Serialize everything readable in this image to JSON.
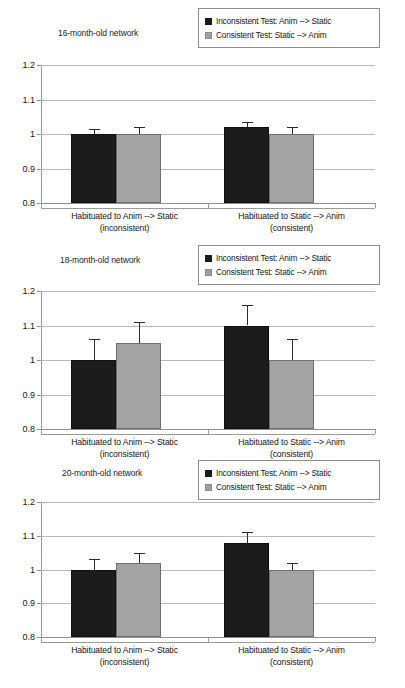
{
  "figure": {
    "panels": [
      {
        "title": "16-month-old network",
        "legend": {
          "items": [
            {
              "swatch": "black-square-icon",
              "label": "Inconsistent Test: Anim --> Static"
            },
            {
              "swatch": "gray-square-icon",
              "label": "Consistent Test: Static --> Anim"
            }
          ]
        },
        "chart_data": {
          "type": "bar",
          "title": "16-month-old network",
          "xlabel": "",
          "ylabel": "",
          "ylim": [
            0.8,
            1.2
          ],
          "yticks": [
            "1.2",
            "1.1",
            "1",
            "0.9",
            "0.8"
          ],
          "ytick_values": [
            1.2,
            1.1,
            1.0,
            0.9,
            0.8
          ],
          "grid": true,
          "legend_position": "top-right",
          "categories": [
            "Habituated to Anim --> Static (inconsistent)",
            "Habituated to Static --> Anim (consistent)"
          ],
          "category_lines": [
            [
              "Habituated to Anim --> Static",
              "(inconsistent)"
            ],
            [
              "Habituated to Static --> Anim",
              "(consistent)"
            ]
          ],
          "series": [
            {
              "name": "Inconsistent Test: Anim --> Static",
              "color": "#1c1c1c",
              "values": [
                1.0,
                1.02
              ],
              "errors": [
                0.015,
                0.015
              ]
            },
            {
              "name": "Consistent Test: Static --> Anim",
              "color": "#a3a3a3",
              "values": [
                1.0,
                1.0
              ],
              "errors": [
                0.02,
                0.02
              ]
            }
          ]
        }
      },
      {
        "title": "18-month-old network",
        "legend": {
          "items": [
            {
              "swatch": "black-square-icon",
              "label": "Inconsistent Test: Anim --> Static"
            },
            {
              "swatch": "gray-square-icon",
              "label": "Consistent Test: Static --> Anim"
            }
          ]
        },
        "chart_data": {
          "type": "bar",
          "title": "18-month-old network",
          "xlabel": "",
          "ylabel": "",
          "ylim": [
            0.8,
            1.2
          ],
          "yticks": [
            "1.2",
            "1.1",
            "1",
            "0.9",
            "0.8"
          ],
          "ytick_values": [
            1.2,
            1.1,
            1.0,
            0.9,
            0.8
          ],
          "grid": true,
          "legend_position": "top-right",
          "categories": [
            "Habituated to Anim --> Static (inconsistent)",
            "Habituated to Static --> Anim (consistent)"
          ],
          "category_lines": [
            [
              "Habituated to Anim --> Static",
              "(inconsistent)"
            ],
            [
              "Habituated to Static --> Anim",
              "(consistent)"
            ]
          ],
          "series": [
            {
              "name": "Inconsistent Test: Anim --> Static",
              "color": "#1c1c1c",
              "values": [
                1.0,
                1.1
              ],
              "errors": [
                0.06,
                0.06
              ]
            },
            {
              "name": "Consistent Test: Static --> Anim",
              "color": "#a3a3a3",
              "values": [
                1.05,
                1.0
              ],
              "errors": [
                0.06,
                0.06
              ]
            }
          ]
        }
      },
      {
        "title": "20-month-old network",
        "legend": {
          "items": [
            {
              "swatch": "black-square-icon",
              "label": "Inconsistent Test: Anim --> Static"
            },
            {
              "swatch": "gray-square-icon",
              "label": "Consistent Test: Static --> Anim"
            }
          ]
        },
        "chart_data": {
          "type": "bar",
          "title": "20-month-old network",
          "xlabel": "",
          "ylabel": "",
          "ylim": [
            0.8,
            1.2
          ],
          "yticks": [
            "1.2",
            "1.1",
            "1",
            "0.9",
            "0.8"
          ],
          "ytick_values": [
            1.2,
            1.1,
            1.0,
            0.9,
            0.8
          ],
          "grid": true,
          "legend_position": "top-right",
          "categories": [
            "Habituated to Anim --> Static (inconsistent)",
            "Habituated to Static --> Anim (consistent)"
          ],
          "category_lines": [
            [
              "Habituated to Anim --> Static",
              "(inconsistent)"
            ],
            [
              "Habituated to Static --> Anim",
              "(consistent)"
            ]
          ],
          "series": [
            {
              "name": "Inconsistent Test: Anim --> Static",
              "color": "#1c1c1c",
              "values": [
                1.0,
                1.08
              ],
              "errors": [
                0.03,
                0.03
              ]
            },
            {
              "name": "Consistent Test: Static --> Anim",
              "color": "#a3a3a3",
              "values": [
                1.02,
                1.0
              ],
              "errors": [
                0.03,
                0.02
              ]
            }
          ]
        }
      }
    ]
  }
}
